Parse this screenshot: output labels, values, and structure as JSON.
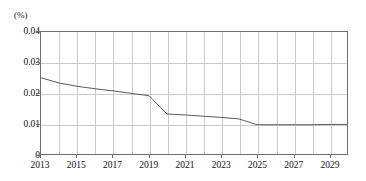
{
  "chart_data": {
    "type": "line",
    "title": "",
    "subtitle": "",
    "xlabel": "",
    "ylabel": "",
    "unit_label": "(%)",
    "grid": true,
    "legend": "none",
    "xlim": [
      2013,
      2030
    ],
    "ylim": [
      0,
      0.04
    ],
    "y_ticks": [
      "0.04",
      "0.03",
      "0.02",
      "0.01",
      "0"
    ],
    "y_tick_values": [
      0.04,
      0.03,
      0.02,
      0.01,
      0
    ],
    "x_ticks": [
      "2013",
      "2015",
      "2017",
      "2019",
      "2021",
      "2023",
      "2025",
      "2027",
      "2029"
    ],
    "x_tick_values": [
      2013,
      2015,
      2017,
      2019,
      2021,
      2023,
      2025,
      2027,
      2029
    ],
    "x_gridline_values": [
      2014,
      2015,
      2016,
      2017,
      2018,
      2019,
      2020,
      2021,
      2022,
      2023,
      2024,
      2025,
      2026,
      2027,
      2028,
      2029
    ],
    "series": [
      {
        "name": "ratio",
        "color": "#595959",
        "x": [
          2013,
          2014,
          2015,
          2016,
          2017,
          2018,
          2019,
          2020,
          2021,
          2022,
          2023,
          2024,
          2025,
          2026,
          2027,
          2028,
          2029,
          2030
        ],
        "values": [
          0.025,
          0.0233,
          0.0222,
          0.0214,
          0.0207,
          0.0199,
          0.0191,
          0.0131,
          0.0128,
          0.0124,
          0.012,
          0.0115,
          0.0096,
          0.0096,
          0.0096,
          0.0096,
          0.0097,
          0.0097
        ]
      }
    ]
  },
  "axis": {
    "unit": "(%)"
  }
}
